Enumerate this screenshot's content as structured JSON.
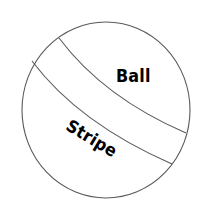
{
  "figure": {
    "kind": "labeled-diagram",
    "background_color": "#ffffff",
    "outline_color": "#595959",
    "outline_width": 1,
    "fill_color": "#ffffff",
    "text_color": "#000000"
  },
  "shapes": {
    "ball": {
      "name": "ball-circle",
      "center_x": 106,
      "center_y": 110,
      "radius_x": 84,
      "radius_y": 88
    },
    "stripe": {
      "name": "stripe-band",
      "upper_edge_start_x": 59,
      "upper_edge_start_y": 38,
      "upper_edge_end_x": 186,
      "upper_edge_end_y": 133,
      "lower_edge_start_x": 32,
      "lower_edge_start_y": 61,
      "lower_edge_end_x": 172,
      "lower_edge_end_y": 164,
      "rotation_deg": 31
    }
  },
  "labels": {
    "ball": "Ball",
    "stripe": "Stripe"
  }
}
